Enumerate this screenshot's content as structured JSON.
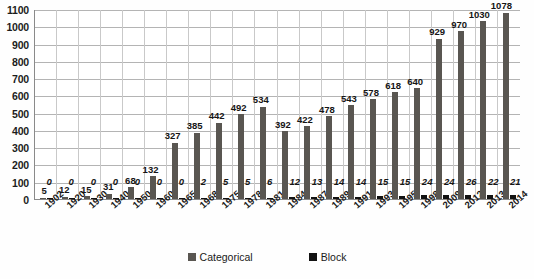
{
  "chart_data": {
    "type": "bar",
    "title": "",
    "subtitle": "",
    "xlabel": "",
    "ylabel": "",
    "ylim": [
      0,
      1100
    ],
    "ytick_step": 100,
    "grid": true,
    "legend_position": "bottom",
    "categories": [
      "1902",
      "1920",
      "1930",
      "1940",
      "1950",
      "1960",
      "1965",
      "1968",
      "1975",
      "1978",
      "1981",
      "1984",
      "1987",
      "1989",
      "1991",
      "1993",
      "1995",
      "1998",
      "2009",
      "2012",
      "2013",
      "2014"
    ],
    "series": [
      {
        "name": "Categorical",
        "color": "#595651",
        "values": [
          5,
          12,
          15,
          31,
          68,
          132,
          327,
          385,
          442,
          492,
          534,
          392,
          422,
          478,
          543,
          578,
          618,
          640,
          929,
          970,
          1030,
          1078
        ]
      },
      {
        "name": "Block",
        "color": "#121212",
        "values": [
          0,
          0,
          0,
          0,
          0,
          0,
          0,
          2,
          5,
          5,
          6,
          12,
          13,
          14,
          14,
          15,
          15,
          24,
          24,
          26,
          22,
          21
        ]
      }
    ],
    "ytick_labels": [
      "1100",
      "1000",
      "900",
      "800",
      "700",
      "600",
      "500",
      "400",
      "300",
      "200",
      "100",
      "0"
    ],
    "ytick_values": [
      1100,
      1000,
      900,
      800,
      700,
      600,
      500,
      400,
      300,
      200,
      100,
      0
    ]
  },
  "legend": {
    "entries": [
      {
        "label": "Categorical",
        "color": "#595651",
        "swatch": "square-swatch"
      },
      {
        "label": "Block",
        "color": "#121212",
        "swatch": "square-swatch"
      }
    ]
  },
  "colors": {
    "categorical_bar": "#595651",
    "block_bar": "#121212",
    "gridline": "#b4b4b4",
    "axis": "#8a8a8a",
    "background": "#ffffff",
    "text": "#1a1a1a"
  }
}
